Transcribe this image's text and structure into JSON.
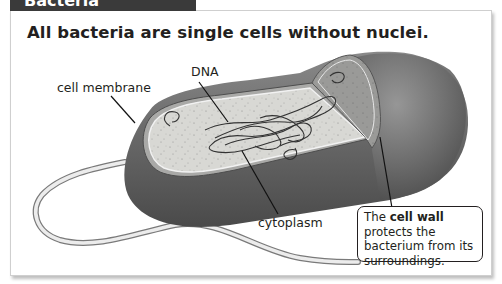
{
  "header": {
    "tab_label": "Bacteria"
  },
  "figure": {
    "title": "All bacteria are single cells without nuclei.",
    "labels": {
      "dna": "DNA",
      "cell_membrane": "cell membrane",
      "cytoplasm": "cytoplasm"
    },
    "callout": {
      "prefix": "The ",
      "term": "cell wall",
      "suffix": " protects the bacterium from its surroundings."
    },
    "colors": {
      "tab": "#3a3a3a",
      "cell_wall": "#5f5f5f",
      "cytoplasm": "#d9d9d6",
      "text": "#231f20"
    }
  }
}
